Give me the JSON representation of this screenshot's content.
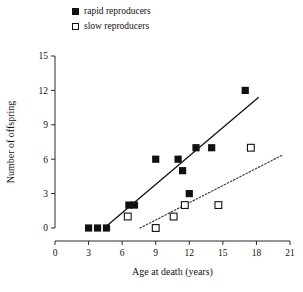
{
  "legend": {
    "items": [
      {
        "label": "rapid reproducers",
        "marker": "filled-square",
        "color": "#111111"
      },
      {
        "label": "slow reproducers",
        "marker": "open-square",
        "color": "#111111"
      }
    ]
  },
  "chart_data": {
    "type": "scatter",
    "title": "",
    "xlabel": "Age at death (years)",
    "ylabel": "Number of offspring",
    "xlim": [
      0,
      21
    ],
    "ylim": [
      0,
      15
    ],
    "xticks": [
      0,
      3,
      6,
      9,
      12,
      15,
      18,
      21
    ],
    "yticks": [
      0,
      3,
      6,
      9,
      12,
      15
    ],
    "grid": false,
    "legend_position": "top",
    "series": [
      {
        "name": "rapid reproducers",
        "marker": "filled-square",
        "color": "#111111",
        "points": [
          [
            3.0,
            0
          ],
          [
            3.8,
            0
          ],
          [
            4.6,
            0
          ],
          [
            6.6,
            2
          ],
          [
            7.1,
            2
          ],
          [
            9.0,
            6
          ],
          [
            11.0,
            6
          ],
          [
            11.4,
            5
          ],
          [
            12.0,
            3
          ],
          [
            12.6,
            7
          ],
          [
            14.0,
            7
          ],
          [
            17.0,
            12
          ]
        ],
        "fit_line": {
          "style": "solid",
          "x": [
            4.4,
            18.2
          ],
          "y": [
            0.0,
            11.4
          ]
        }
      },
      {
        "name": "slow reproducers",
        "marker": "open-square",
        "color": "#111111",
        "points": [
          [
            6.5,
            1
          ],
          [
            9.0,
            0
          ],
          [
            10.6,
            1
          ],
          [
            11.6,
            2
          ],
          [
            14.6,
            2
          ],
          [
            17.5,
            7
          ]
        ],
        "fit_line": {
          "style": "dotted",
          "x": [
            7.6,
            20.4
          ],
          "y": [
            0.0,
            6.4
          ]
        }
      }
    ]
  }
}
